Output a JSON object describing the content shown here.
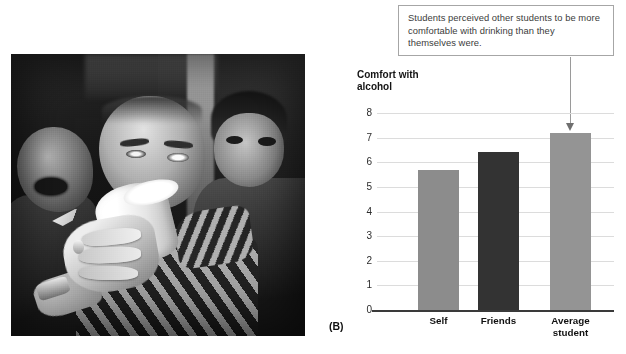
{
  "figure": {
    "panel_label": "(B)",
    "photo_alt": "black-and-white photo of a man drinking from a plastic cup at a party with other students around him"
  },
  "callout": {
    "text": "Students perceived other students to be more comfortable with drinking than they themselves were.",
    "border_color": "#a6a6a6",
    "arrow_color": "#9a9a9a",
    "points_to": "Average student"
  },
  "chart_data": {
    "type": "bar",
    "title": "",
    "xlabel": "",
    "ylabel": "Comfort with alcohol",
    "ylabel_line1": "Comfort with",
    "ylabel_line2": "alcohol",
    "categories": [
      "Self",
      "Friends",
      "Average student"
    ],
    "category_lines": [
      [
        "Self"
      ],
      [
        "Friends"
      ],
      [
        "Average",
        "student"
      ]
    ],
    "values": [
      5.7,
      6.4,
      7.2
    ],
    "bar_colors": [
      "#8c8c8c",
      "#333333",
      "#949494"
    ],
    "ylim": [
      0,
      8
    ],
    "yticks": [
      0,
      1,
      2,
      3,
      4,
      5,
      6,
      7,
      8
    ],
    "ytick_labels": [
      "0",
      "1",
      "2",
      "3",
      "4",
      "5",
      "6",
      "7",
      "8"
    ],
    "grid": true,
    "grid_color": "#dcdcdc",
    "legend": "none",
    "axis_color": "#3a3a3a"
  }
}
